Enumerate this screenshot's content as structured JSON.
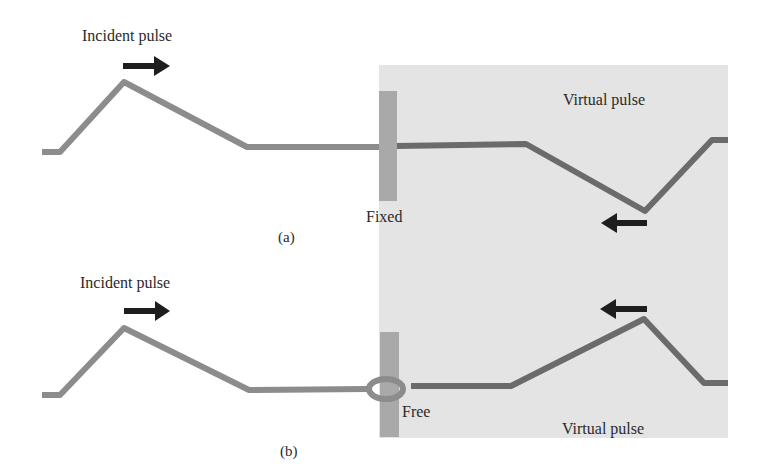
{
  "figure": {
    "colors": {
      "background": "#ffffff",
      "virtual_region": "#e4e4e4",
      "wall": "#a9a9a9",
      "incident_string": "#8c8c8c",
      "virtual_string": "#6b6b6b",
      "arrow": "#1e1e1e",
      "text": "#2a2a2a"
    },
    "panel_a": {
      "caption": "(a)",
      "incident_label": "Incident pulse",
      "boundary_label": "Fixed",
      "virtual_label": "Virtual pulse",
      "incident_direction": "right",
      "virtual_direction": "left",
      "virtual_pulse_orientation": "inverted"
    },
    "panel_b": {
      "caption": "(b)",
      "incident_label": "Incident pulse",
      "boundary_label": "Free",
      "virtual_label": "Virtual pulse",
      "incident_direction": "right",
      "virtual_direction": "left",
      "virtual_pulse_orientation": "upright"
    }
  }
}
